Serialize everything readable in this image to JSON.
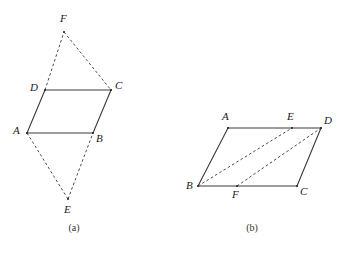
{
  "figure": {
    "background_color": "#ffffff",
    "stroke_color": "#3a3a3a",
    "dashed_color": "#4a4a4a",
    "label_color": "#1a1a1a",
    "panels": [
      {
        "id": "panel-a",
        "caption": "(a)",
        "caption_x": 74,
        "caption_y": 231,
        "description": "Parallelogram ABCD with dashed triangle apexes E below and F above",
        "vertices": [
          {
            "name": "A",
            "x": 27,
            "y": 133,
            "label_x": 13,
            "label_y": 134
          },
          {
            "name": "B",
            "x": 93,
            "y": 133,
            "label_x": 96,
            "label_y": 142
          },
          {
            "name": "C",
            "x": 111,
            "y": 90,
            "label_x": 115,
            "label_y": 89
          },
          {
            "name": "D",
            "x": 45,
            "y": 90,
            "label_x": 30,
            "label_y": 91
          },
          {
            "name": "E",
            "x": 68,
            "y": 199,
            "label_x": 64,
            "label_y": 213
          },
          {
            "name": "F",
            "x": 64,
            "y": 32,
            "label_x": 60,
            "label_y": 22
          }
        ],
        "solid_edges": [
          {
            "from": "A",
            "to": "B"
          },
          {
            "from": "B",
            "to": "C"
          },
          {
            "from": "C",
            "to": "D"
          },
          {
            "from": "D",
            "to": "A"
          }
        ],
        "dashed_edges": [
          {
            "from": "D",
            "to": "F"
          },
          {
            "from": "F",
            "to": "C"
          },
          {
            "from": "A",
            "to": "E"
          },
          {
            "from": "E",
            "to": "B"
          }
        ]
      },
      {
        "id": "panel-b",
        "caption": "(b)",
        "caption_x": 252,
        "caption_y": 231,
        "description": "Parallelogram ABCD (A top-left, D top-right, B bottom-left, C bottom-right) with points E on AD and F on BC, and dashed segments BE and FD",
        "vertices": [
          {
            "name": "A",
            "x": 228,
            "y": 128,
            "label_x": 222,
            "label_y": 120
          },
          {
            "name": "B",
            "x": 198,
            "y": 186,
            "label_x": 186,
            "label_y": 189
          },
          {
            "name": "C",
            "x": 297,
            "y": 186,
            "label_x": 300,
            "label_y": 195
          },
          {
            "name": "D",
            "x": 321,
            "y": 128,
            "label_x": 324,
            "label_y": 124
          },
          {
            "name": "E",
            "x": 292,
            "y": 128,
            "label_x": 287,
            "label_y": 120
          },
          {
            "name": "F",
            "x": 237,
            "y": 186,
            "label_x": 232,
            "label_y": 198
          }
        ],
        "solid_edges": [
          {
            "from": "A",
            "to": "D"
          },
          {
            "from": "D",
            "to": "C"
          },
          {
            "from": "C",
            "to": "B"
          },
          {
            "from": "B",
            "to": "A"
          }
        ],
        "dashed_edges": [
          {
            "from": "B",
            "to": "E"
          },
          {
            "from": "F",
            "to": "D"
          }
        ]
      }
    ]
  }
}
